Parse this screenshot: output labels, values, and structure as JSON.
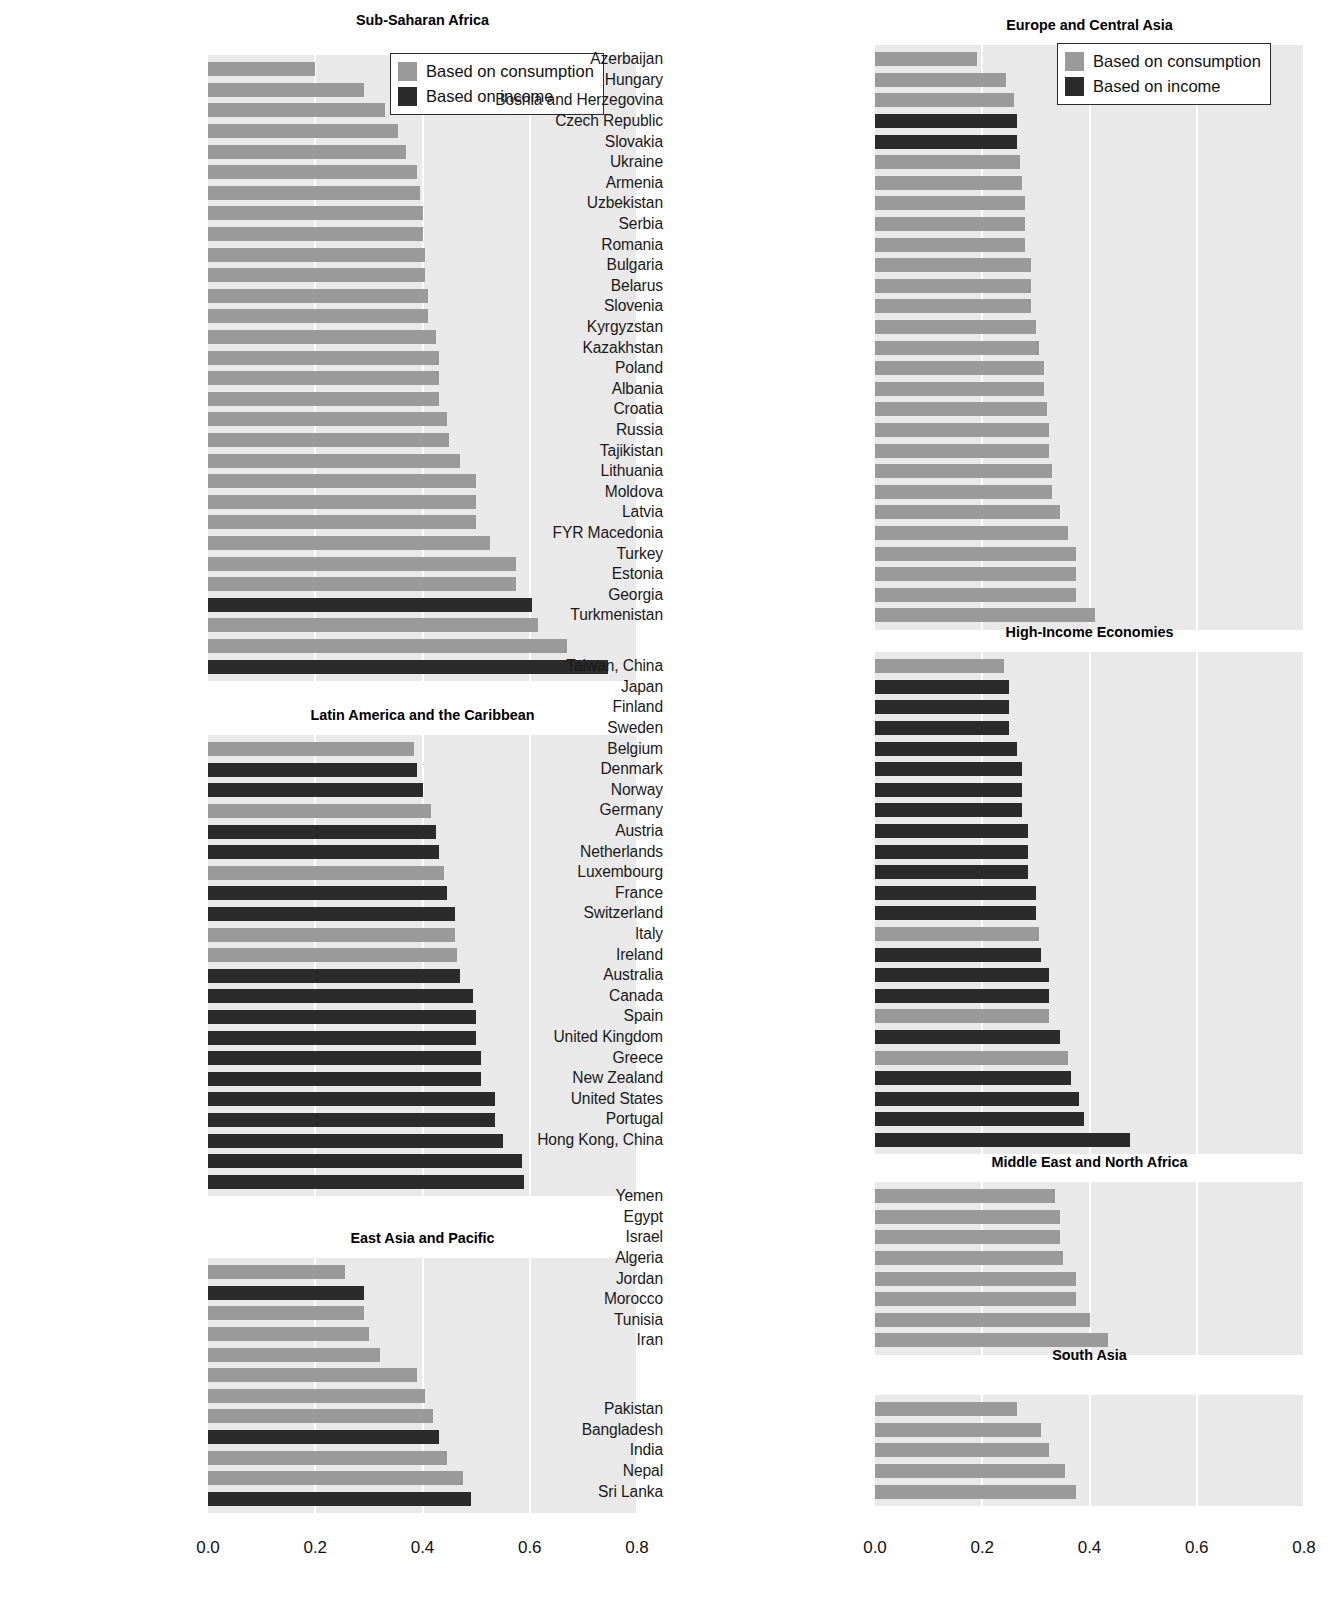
{
  "legend": {
    "consumption_label": "Based on consumption",
    "income_label": "Based on income",
    "consumption_color": "#9a9a9a",
    "income_color": "#2b2b2b"
  },
  "axis": {
    "ticks": [
      "0.0",
      "0.2",
      "0.4",
      "0.6",
      "0.8"
    ],
    "min": 0.0,
    "max": 0.8
  },
  "chart_data": {
    "type": "bar",
    "orientation": "horizontal",
    "title": "",
    "xlabel": "",
    "ylabel": "",
    "xlim": [
      0.0,
      0.8
    ],
    "xticks": [
      0.0,
      0.2,
      0.4,
      0.6,
      0.8
    ],
    "grid": "vertical",
    "legend_position": "top-right of first panel in each column",
    "series": [
      {
        "name": "Based on consumption",
        "color": "#9a9a9a"
      },
      {
        "name": "Based on income",
        "color": "#2b2b2b"
      }
    ],
    "panels": [
      {
        "title": "Sub-Saharan Africa",
        "column": "left",
        "items": [
          {
            "label": "Mauritius",
            "value": 0.2,
            "basis": "consumption"
          },
          {
            "label": "Ethiopia",
            "value": 0.29,
            "basis": "consumption"
          },
          {
            "label": "Niger",
            "value": 0.33,
            "basis": "consumption"
          },
          {
            "label": "Tanzania",
            "value": 0.355,
            "basis": "consumption"
          },
          {
            "label": "Benin",
            "value": 0.37,
            "basis": "consumption"
          },
          {
            "label": "Mauritania",
            "value": 0.39,
            "basis": "consumption"
          },
          {
            "label": "Guinea",
            "value": 0.395,
            "basis": "consumption"
          },
          {
            "label": "Ghana",
            "value": 0.4,
            "basis": "consumption"
          },
          {
            "label": "Mali",
            "value": 0.4,
            "basis": "consumption"
          },
          {
            "label": "Mozambique",
            "value": 0.405,
            "basis": "consumption"
          },
          {
            "label": "Senegal",
            "value": 0.405,
            "basis": "consumption"
          },
          {
            "label": "Angola",
            "value": 0.41,
            "basis": "consumption"
          },
          {
            "label": "Burkina Faso",
            "value": 0.41,
            "basis": "consumption"
          },
          {
            "label": "Nigeria",
            "value": 0.425,
            "basis": "consumption"
          },
          {
            "label": "Burundi",
            "value": 0.43,
            "basis": "consumption"
          },
          {
            "label": "Cameroon",
            "value": 0.43,
            "basis": "consumption"
          },
          {
            "label": "Uganda",
            "value": 0.43,
            "basis": "consumption"
          },
          {
            "label": "Kenya",
            "value": 0.445,
            "basis": "consumption"
          },
          {
            "label": "Côte d’Ivoire",
            "value": 0.45,
            "basis": "consumption"
          },
          {
            "label": "Madagascar",
            "value": 0.47,
            "basis": "consumption"
          },
          {
            "label": "Zimbabwe",
            "value": 0.5,
            "basis": "consumption"
          },
          {
            "label": "Gambia, The",
            "value": 0.5,
            "basis": "consumption"
          },
          {
            "label": "Malawi",
            "value": 0.5,
            "basis": "consumption"
          },
          {
            "label": "Zambia",
            "value": 0.525,
            "basis": "consumption"
          },
          {
            "label": "South Africa",
            "value": 0.575,
            "basis": "consumption"
          },
          {
            "label": "Lesotho",
            "value": 0.575,
            "basis": "consumption"
          },
          {
            "label": "Swaziland",
            "value": 0.605,
            "basis": "income"
          },
          {
            "label": "Central African Republic",
            "value": 0.615,
            "basis": "consumption"
          },
          {
            "label": "Botswana",
            "value": 0.67,
            "basis": "consumption"
          },
          {
            "label": "Namibia",
            "value": 0.745,
            "basis": "income"
          }
        ]
      },
      {
        "title": "Latin America and the Caribbean",
        "column": "left",
        "items": [
          {
            "label": "Peru",
            "value": 0.385,
            "basis": "consumption"
          },
          {
            "label": "Trinidad and Tobago",
            "value": 0.39,
            "basis": "income"
          },
          {
            "label": "Nicaragua",
            "value": 0.4,
            "basis": "income"
          },
          {
            "label": "Jamaica",
            "value": 0.415,
            "basis": "consumption"
          },
          {
            "label": "R.B. de Venezuela",
            "value": 0.425,
            "basis": "income"
          },
          {
            "label": "Uruguay",
            "value": 0.43,
            "basis": "income"
          },
          {
            "label": "St. Lucia",
            "value": 0.44,
            "basis": "consumption"
          },
          {
            "label": "Guyana",
            "value": 0.445,
            "basis": "income"
          },
          {
            "label": "Costa Rica",
            "value": 0.46,
            "basis": "income"
          },
          {
            "label": "Guatemala",
            "value": 0.46,
            "basis": "consumption"
          },
          {
            "label": "Panama",
            "value": 0.465,
            "basis": "consumption"
          },
          {
            "label": "Dominican Republic",
            "value": 0.47,
            "basis": "income"
          },
          {
            "label": "Mexico",
            "value": 0.495,
            "basis": "income"
          },
          {
            "label": "El Salvador",
            "value": 0.5,
            "basis": "income"
          },
          {
            "label": "Honduras",
            "value": 0.5,
            "basis": "income"
          },
          {
            "label": "Argentina",
            "value": 0.51,
            "basis": "income"
          },
          {
            "label": "Chile",
            "value": 0.51,
            "basis": "income"
          },
          {
            "label": "Ecuador",
            "value": 0.535,
            "basis": "income"
          },
          {
            "label": "Colombia",
            "value": 0.535,
            "basis": "income"
          },
          {
            "label": "Paraguay",
            "value": 0.55,
            "basis": "income"
          },
          {
            "label": "Bolivia",
            "value": 0.585,
            "basis": "income"
          },
          {
            "label": "Brazil",
            "value": 0.59,
            "basis": "income"
          }
        ]
      },
      {
        "title": "East Asia and Pacific",
        "column": "left",
        "items": [
          {
            "label": "Vietnam",
            "value": 0.255,
            "basis": "consumption"
          },
          {
            "label": "Rep. of Korea",
            "value": 0.29,
            "basis": "income"
          },
          {
            "label": "Indonesia",
            "value": 0.29,
            "basis": "consumption"
          },
          {
            "label": "Mongolia",
            "value": 0.3,
            "basis": "consumption"
          },
          {
            "label": "Lao PDR",
            "value": 0.32,
            "basis": "consumption"
          },
          {
            "label": "Thailand",
            "value": 0.39,
            "basis": "consumption"
          },
          {
            "label": "Cambodia",
            "value": 0.405,
            "basis": "consumption"
          },
          {
            "label": "Philippines",
            "value": 0.42,
            "basis": "consumption"
          },
          {
            "label": "Singapore",
            "value": 0.43,
            "basis": "income"
          },
          {
            "label": "China",
            "value": 0.445,
            "basis": "consumption"
          },
          {
            "label": "Papua New Guinea",
            "value": 0.475,
            "basis": "consumption"
          },
          {
            "label": "Malaysia",
            "value": 0.49,
            "basis": "income"
          }
        ]
      },
      {
        "title": "Europe and Central Asia",
        "column": "right",
        "items": [
          {
            "label": "Azerbaijan",
            "value": 0.19,
            "basis": "consumption"
          },
          {
            "label": "Hungary",
            "value": 0.245,
            "basis": "consumption"
          },
          {
            "label": "Bosnia and Herzegovina",
            "value": 0.26,
            "basis": "consumption"
          },
          {
            "label": "Czech Republic",
            "value": 0.265,
            "basis": "income"
          },
          {
            "label": "Slovakia",
            "value": 0.265,
            "basis": "income"
          },
          {
            "label": "Ukraine",
            "value": 0.27,
            "basis": "consumption"
          },
          {
            "label": "Armenia",
            "value": 0.275,
            "basis": "consumption"
          },
          {
            "label": "Uzbekistan",
            "value": 0.28,
            "basis": "consumption"
          },
          {
            "label": "Serbia",
            "value": 0.28,
            "basis": "consumption"
          },
          {
            "label": "Romania",
            "value": 0.28,
            "basis": "consumption"
          },
          {
            "label": "Bulgaria",
            "value": 0.29,
            "basis": "consumption"
          },
          {
            "label": "Belarus",
            "value": 0.29,
            "basis": "consumption"
          },
          {
            "label": "Slovenia",
            "value": 0.29,
            "basis": "consumption"
          },
          {
            "label": "Kyrgyzstan",
            "value": 0.3,
            "basis": "consumption"
          },
          {
            "label": "Kazakhstan",
            "value": 0.305,
            "basis": "consumption"
          },
          {
            "label": "Poland",
            "value": 0.315,
            "basis": "consumption"
          },
          {
            "label": "Albania",
            "value": 0.315,
            "basis": "consumption"
          },
          {
            "label": "Croatia",
            "value": 0.32,
            "basis": "consumption"
          },
          {
            "label": "Russia",
            "value": 0.325,
            "basis": "consumption"
          },
          {
            "label": "Tajikistan",
            "value": 0.325,
            "basis": "consumption"
          },
          {
            "label": "Lithuania",
            "value": 0.33,
            "basis": "consumption"
          },
          {
            "label": "Moldova",
            "value": 0.33,
            "basis": "consumption"
          },
          {
            "label": "Latvia",
            "value": 0.345,
            "basis": "consumption"
          },
          {
            "label": "FYR Macedonia",
            "value": 0.36,
            "basis": "consumption"
          },
          {
            "label": "Turkey",
            "value": 0.375,
            "basis": "consumption"
          },
          {
            "label": "Estonia",
            "value": 0.375,
            "basis": "consumption"
          },
          {
            "label": "Georgia",
            "value": 0.375,
            "basis": "consumption"
          },
          {
            "label": "Turkmenistan",
            "value": 0.41,
            "basis": "consumption"
          }
        ]
      },
      {
        "title": "High-Income Economies",
        "column": "right",
        "items": [
          {
            "label": "Taiwan, China",
            "value": 0.24,
            "basis": "consumption"
          },
          {
            "label": "Japan",
            "value": 0.25,
            "basis": "income"
          },
          {
            "label": "Finland",
            "value": 0.25,
            "basis": "income"
          },
          {
            "label": "Sweden",
            "value": 0.25,
            "basis": "income"
          },
          {
            "label": "Belgium",
            "value": 0.265,
            "basis": "income"
          },
          {
            "label": "Denmark",
            "value": 0.275,
            "basis": "income"
          },
          {
            "label": "Norway",
            "value": 0.275,
            "basis": "income"
          },
          {
            "label": "Germany",
            "value": 0.275,
            "basis": "income"
          },
          {
            "label": "Austria",
            "value": 0.285,
            "basis": "income"
          },
          {
            "label": "Netherlands",
            "value": 0.285,
            "basis": "income"
          },
          {
            "label": "Luxembourg",
            "value": 0.285,
            "basis": "income"
          },
          {
            "label": "France",
            "value": 0.3,
            "basis": "income"
          },
          {
            "label": "Switzerland",
            "value": 0.3,
            "basis": "income"
          },
          {
            "label": "Italy",
            "value": 0.305,
            "basis": "consumption"
          },
          {
            "label": "Ireland",
            "value": 0.31,
            "basis": "income"
          },
          {
            "label": "Australia",
            "value": 0.325,
            "basis": "income"
          },
          {
            "label": "Canada",
            "value": 0.325,
            "basis": "income"
          },
          {
            "label": "Spain",
            "value": 0.325,
            "basis": "consumption"
          },
          {
            "label": "United Kingdom",
            "value": 0.345,
            "basis": "income"
          },
          {
            "label": "Greece",
            "value": 0.36,
            "basis": "consumption"
          },
          {
            "label": "New Zealand",
            "value": 0.365,
            "basis": "income"
          },
          {
            "label": "United States",
            "value": 0.38,
            "basis": "income"
          },
          {
            "label": "Portugal",
            "value": 0.39,
            "basis": "income"
          },
          {
            "label": "Hong Kong, China",
            "value": 0.475,
            "basis": "income"
          }
        ]
      },
      {
        "title": "Middle East and North Africa",
        "column": "right",
        "items": [
          {
            "label": "Yemen",
            "value": 0.335,
            "basis": "consumption"
          },
          {
            "label": "Egypt",
            "value": 0.345,
            "basis": "consumption"
          },
          {
            "label": "Israel",
            "value": 0.345,
            "basis": "consumption"
          },
          {
            "label": "Algeria",
            "value": 0.35,
            "basis": "consumption"
          },
          {
            "label": "Jordan",
            "value": 0.375,
            "basis": "consumption"
          },
          {
            "label": "Morocco",
            "value": 0.375,
            "basis": "consumption"
          },
          {
            "label": "Tunisia",
            "value": 0.4,
            "basis": "consumption"
          },
          {
            "label": "Iran",
            "value": 0.435,
            "basis": "consumption"
          }
        ]
      },
      {
        "title": "South Asia",
        "column": "right",
        "items": [
          {
            "label": "Pakistan",
            "value": 0.265,
            "basis": "consumption"
          },
          {
            "label": "Bangladesh",
            "value": 0.31,
            "basis": "consumption"
          },
          {
            "label": "India",
            "value": 0.325,
            "basis": "consumption"
          },
          {
            "label": "Nepal",
            "value": 0.355,
            "basis": "consumption"
          },
          {
            "label": "Sri Lanka",
            "value": 0.375,
            "basis": "consumption"
          }
        ]
      }
    ]
  }
}
